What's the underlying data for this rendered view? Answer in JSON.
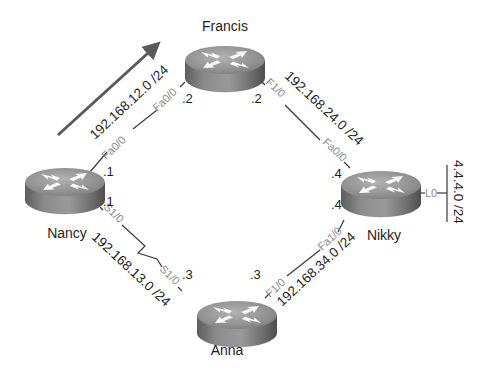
{
  "diagram": {
    "colors": {
      "router_top": "#8f8f8f",
      "router_side": "#6f6f6f",
      "arrow": "#5a5a5a",
      "link": "#3a3a3a",
      "interface_label": "#8a8a8a",
      "text": "#1e1e1e"
    },
    "routers": [
      {
        "id": "francis",
        "name": "Francis"
      },
      {
        "id": "nancy",
        "name": "Nancy"
      },
      {
        "id": "nikky",
        "name": "Nikky"
      },
      {
        "id": "anna",
        "name": "Anna"
      }
    ],
    "links": [
      {
        "id": "nancy-francis",
        "network": "192.168.12.0 /24",
        "type": "ethernet",
        "a": {
          "router": "Nancy",
          "interface": "Fa0/0",
          "ip": ".1"
        },
        "b": {
          "router": "Francis",
          "interface": "Fa0/0",
          "ip": ".2"
        }
      },
      {
        "id": "francis-nikky",
        "network": "192.168.24.0 /24",
        "type": "ethernet",
        "a": {
          "router": "Francis",
          "interface": "F1/0",
          "ip": ".2"
        },
        "b": {
          "router": "Nikky",
          "interface": "Fa0/0",
          "ip": ".4"
        }
      },
      {
        "id": "nancy-anna",
        "network": "192.168.13.0 /24",
        "type": "serial",
        "a": {
          "router": "Nancy",
          "interface": "S1/0",
          "ip": ".1"
        },
        "b": {
          "router": "Anna",
          "interface": "S1/0",
          "ip": ".3"
        }
      },
      {
        "id": "anna-nikky",
        "network": "192.168.34.0 /24",
        "type": "ethernet",
        "a": {
          "router": "Anna",
          "interface": "F1/0",
          "ip": ".3"
        },
        "b": {
          "router": "Nikky",
          "interface": "Fa1/0",
          "ip": ".4"
        }
      }
    ],
    "loopback": {
      "router": "Nikky",
      "interface": "L0",
      "network": "4.4.4.0 /24"
    },
    "arrow": {
      "icon": "direction-arrow-icon",
      "along": "192.168.12.0 /24"
    }
  }
}
